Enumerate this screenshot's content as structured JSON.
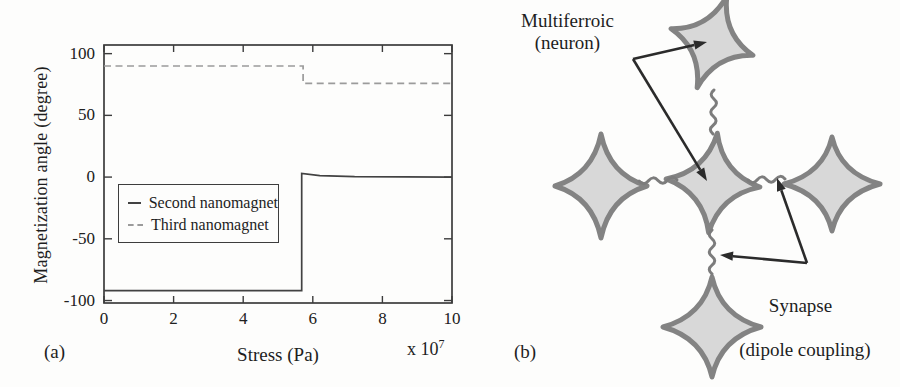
{
  "figure": {
    "panel_a_label": "(a)",
    "panel_b_label": "(b)"
  },
  "chart_data": {
    "type": "line",
    "title": "",
    "xlabel": "Stress (Pa)",
    "x_multiplier_base": "x 10",
    "x_multiplier_exponent": "7",
    "ylabel": "Magnetization angle (degree)",
    "xlim": [
      0,
      10
    ],
    "ylim": [
      -102,
      107
    ],
    "xticks": [
      0,
      2,
      4,
      6,
      8,
      10
    ],
    "yticks": [
      -100,
      -50,
      0,
      50,
      100
    ],
    "grid": false,
    "legend_position": "middle-left",
    "series": [
      {
        "name": "Second nanomagnet",
        "style": "solid",
        "color": "#424242",
        "x": [
          0,
          5.68,
          5.68,
          6.2,
          7.2,
          10
        ],
        "y": [
          -92,
          -92,
          3,
          1.2,
          0.3,
          0
        ]
      },
      {
        "name": "Third nanomagnet",
        "style": "dashed",
        "color": "#9b9b9b",
        "x": [
          0,
          5.72,
          5.72,
          10
        ],
        "y": [
          90,
          90,
          76,
          76
        ]
      }
    ]
  },
  "diagram": {
    "neuron_label_line1": "Multiferroic",
    "neuron_label_line2": "(neuron)",
    "synapse_label_line1": "Synapse",
    "synapse_label_line2": "(dipole coupling)",
    "nodes": [
      "top",
      "left",
      "center",
      "right",
      "bottom"
    ],
    "springs": [
      "top-center",
      "left-center",
      "center-right",
      "center-bottom"
    ],
    "star_fill": "#d8d8d8",
    "star_stroke": "#838383",
    "spring_color": "#7c7c7c",
    "arrow_color": "#2b2b2b"
  }
}
